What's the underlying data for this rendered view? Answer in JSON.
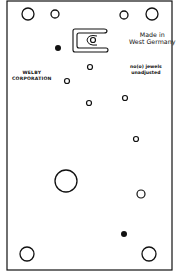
{
  "diagram": {
    "labels": {
      "made_in_line1": "Made in",
      "made_in_line2": "West Germany",
      "jewels_line1": "no(o) jewels",
      "jewels_line2": "unadjusted",
      "maker_line1": "WELBY",
      "maker_line2": "CORPORATION"
    },
    "colors": {
      "stroke": "#111111",
      "background": "#ffffff"
    },
    "plate": {
      "x": 7,
      "y": 1,
      "width": 165,
      "height": 269
    },
    "holes": [
      {
        "cx": 28,
        "cy": 14,
        "r": 6,
        "filled": false
      },
      {
        "cx": 55,
        "cy": 14,
        "r": 4,
        "filled": false
      },
      {
        "cx": 124,
        "cy": 15,
        "r": 4,
        "filled": false
      },
      {
        "cx": 152,
        "cy": 14,
        "r": 6,
        "filled": false
      },
      {
        "cx": 58,
        "cy": 48,
        "r": 3,
        "filled": true
      },
      {
        "cx": 93,
        "cy": 40,
        "r": 2.5,
        "filled": false
      },
      {
        "cx": 90,
        "cy": 67,
        "r": 2.5,
        "filled": false
      },
      {
        "cx": 67,
        "cy": 81,
        "r": 2.5,
        "filled": false
      },
      {
        "cx": 89,
        "cy": 103,
        "r": 2.5,
        "filled": false
      },
      {
        "cx": 125,
        "cy": 98,
        "r": 2.5,
        "filled": false
      },
      {
        "cx": 136,
        "cy": 139,
        "r": 2.5,
        "filled": false
      },
      {
        "cx": 66,
        "cy": 181,
        "r": 11,
        "filled": false
      },
      {
        "cx": 141,
        "cy": 194,
        "r": 4,
        "filled": false
      },
      {
        "cx": 124,
        "cy": 234,
        "r": 3,
        "filled": true
      },
      {
        "cx": 27,
        "cy": 254,
        "r": 7,
        "filled": false
      },
      {
        "cx": 149,
        "cy": 254,
        "r": 7,
        "filled": false
      }
    ]
  }
}
